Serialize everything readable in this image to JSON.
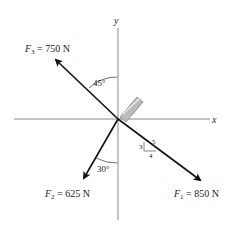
{
  "axes": {
    "x_label": "x",
    "y_label": "y"
  },
  "forces": [
    {
      "id": "F1",
      "symbol": "F",
      "sub": "1",
      "label": " = 850 N",
      "magnitude": "850 N"
    },
    {
      "id": "F2",
      "symbol": "F",
      "sub": "2",
      "label": " = 625 N",
      "magnitude": "625 N"
    },
    {
      "id": "F3",
      "symbol": "F",
      "sub": "3",
      "label": " = 750 N",
      "magnitude": "750 N"
    }
  ],
  "angles": {
    "f3_angle": "45°",
    "f2_angle": "30°"
  },
  "slope_triangle": {
    "rise": "3",
    "run": "4",
    "hyp": "5"
  },
  "colors": {
    "line": "#111111",
    "axis": "#888888",
    "bolt": "#aaaaaa"
  }
}
